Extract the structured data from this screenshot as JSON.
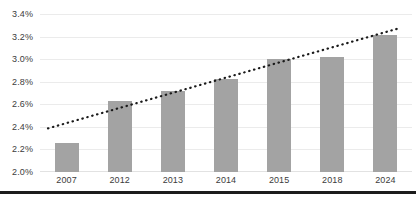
{
  "chart_data": {
    "type": "bar",
    "title": "",
    "subtitle": "",
    "xlabel": "",
    "ylabel": "",
    "categories": [
      "2007",
      "2012",
      "2013",
      "2014",
      "2015",
      "2018",
      "2024"
    ],
    "values": [
      2.26,
      2.63,
      2.72,
      2.83,
      3.01,
      3.03,
      3.22
    ],
    "value_format": "percent",
    "ylim": [
      2.0,
      3.4
    ],
    "ytick_step": 0.2,
    "ytick_labels": [
      "3.4%",
      "3.2%",
      "3.0%",
      "2.8%",
      "2.6%",
      "2.4%",
      "2.2%",
      "2.0%"
    ],
    "ytick_values": [
      3.4,
      3.2,
      3.0,
      2.8,
      2.6,
      2.4,
      2.2,
      2.0
    ],
    "grid": true,
    "legend": false,
    "legend_position": "none",
    "series": [
      {
        "name": "bars",
        "type": "bar",
        "color": "#a3a3a3",
        "values": [
          2.26,
          2.63,
          2.72,
          2.83,
          3.01,
          3.03,
          3.22
        ]
      },
      {
        "name": "trendline",
        "type": "line",
        "style": "dotted",
        "color": "#1a1a1a",
        "start_value": 2.38,
        "end_value": 3.27
      }
    ],
    "annotations": []
  },
  "colors": {
    "bar": "#a3a3a3",
    "grid": "#ebebeb",
    "trendline": "#1a1a1a",
    "axis_text": "#3c3c3c",
    "bottom_rule": "#1c1c1c",
    "background": "#ffffff"
  }
}
